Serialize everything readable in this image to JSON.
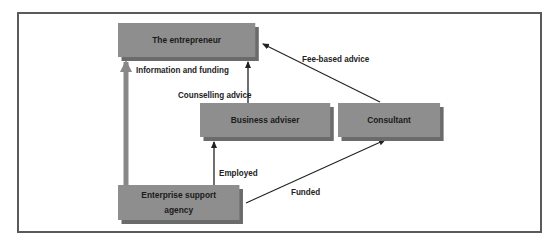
{
  "diagram": {
    "nodes": {
      "entrepreneur": {
        "label": "The entrepreneur"
      },
      "business_adviser": {
        "label": "Business adviser"
      },
      "consultant": {
        "label": "Consultant"
      },
      "agency": {
        "label_line1": "Enterprise support",
        "label_line2": "agency"
      }
    },
    "edges": {
      "info_funding": {
        "label": "Information and funding",
        "from": "Enterprise support agency",
        "to": "The entrepreneur"
      },
      "counselling": {
        "label": "Counselling advice",
        "from": "Business adviser",
        "to": "The entrepreneur"
      },
      "fee_based": {
        "label": "Fee-based advice",
        "from": "Consultant",
        "to": "The entrepreneur"
      },
      "employed": {
        "label": "Employed",
        "from": "Enterprise support agency",
        "to": "Business adviser"
      },
      "funded": {
        "label": "Funded",
        "from": "Enterprise support agency",
        "to": "Consultant"
      }
    },
    "colors": {
      "box_fill": "#8e8e8e",
      "box_shadow": "#6b6b6b",
      "frame": "#5a5a5a",
      "thick_arrow": "#888888",
      "line": "#222222"
    }
  }
}
